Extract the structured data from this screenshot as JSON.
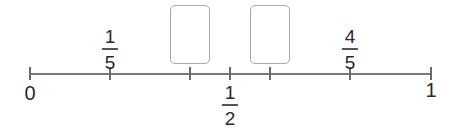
{
  "number_line": {
    "range": [
      0,
      1
    ],
    "ticks": [
      {
        "position": 0,
        "x": 30
      },
      {
        "position": 0.2,
        "x": 110
      },
      {
        "position": 0.4,
        "x": 190
      },
      {
        "position": 0.5,
        "x": 230
      },
      {
        "position": 0.6,
        "x": 270
      },
      {
        "position": 0.8,
        "x": 350
      },
      {
        "position": 1,
        "x": 431
      }
    ],
    "labels": {
      "zero": "0",
      "one": "1",
      "one_fifth": {
        "numerator": "1",
        "denominator": "5"
      },
      "one_half": {
        "numerator": "1",
        "denominator": "2"
      },
      "four_fifths": {
        "numerator": "4",
        "denominator": "5"
      }
    },
    "answer_boxes": [
      {
        "position": 0.4,
        "value": ""
      },
      {
        "position": 0.6,
        "value": ""
      }
    ]
  }
}
